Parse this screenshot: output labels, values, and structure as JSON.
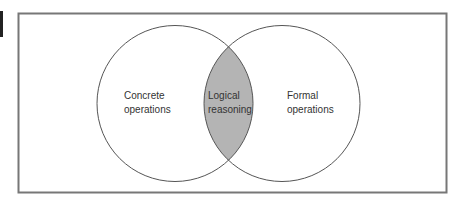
{
  "diagram": {
    "type": "venn",
    "sets": [
      {
        "id": "left",
        "label_line1": "Concrete",
        "label_line2": "operations"
      },
      {
        "id": "right",
        "label_line1": "Formal",
        "label_line2": "operations"
      }
    ],
    "intersection": {
      "label_line1": "Logical",
      "label_line2": "reasoning"
    },
    "colors": {
      "frame": "#777777",
      "circle_stroke": "#555555",
      "intersection_fill": "#b4b4b4",
      "background": "#ffffff",
      "text": "#333333"
    }
  }
}
